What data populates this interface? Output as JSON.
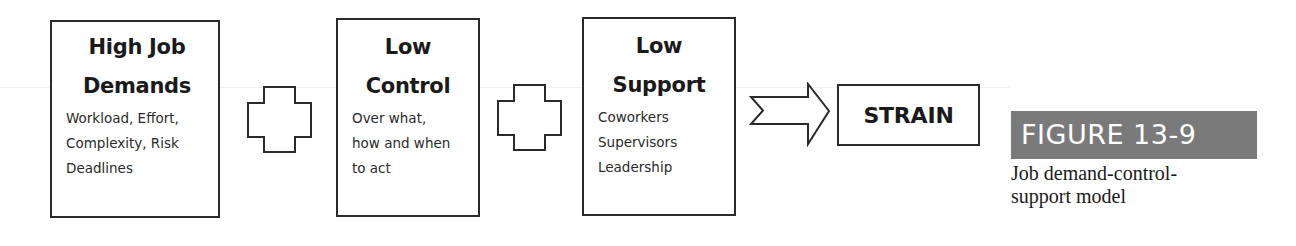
{
  "diagram": {
    "boxes": [
      {
        "id": "demands",
        "title_lines": [
          "High Job",
          "Demands"
        ],
        "detail_lines": [
          "Workload, Effort,",
          "Complexity, Risk",
          "Deadlines"
        ]
      },
      {
        "id": "control",
        "title_lines": [
          "Low",
          "Control"
        ],
        "detail_lines": [
          "Over what,",
          "how and when",
          "to act"
        ]
      },
      {
        "id": "support",
        "title_lines": [
          "Low",
          "Support"
        ],
        "detail_lines": [
          "Coworkers",
          "Supervisors",
          "Leadership"
        ]
      }
    ],
    "operators": [
      "plus-icon",
      "plus-icon"
    ],
    "arrow": "right-arrow-icon",
    "result": {
      "label": "STRAIN"
    }
  },
  "figure": {
    "label": "FIGURE 13-9",
    "caption_lines": [
      "Job demand-control-",
      "support model"
    ],
    "label_bg_color": "#7a7a7a"
  }
}
